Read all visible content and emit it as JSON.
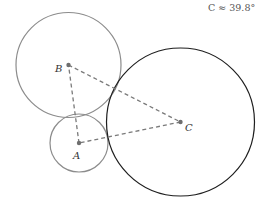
{
  "annotation": {
    "text": "C ≈ 39.8°",
    "x": 208,
    "y": 11
  },
  "colors": {
    "small_circles": "#8c8c8c",
    "large_circle": "#1e1e1e",
    "dashed_lines": "#7a7a7a",
    "points": "#6e6e6e",
    "labels": "#333333"
  },
  "points": {
    "A": {
      "label": "A",
      "x": 79,
      "y": 143,
      "label_x": 73,
      "label_y": 159
    },
    "B": {
      "label": "B",
      "x": 68.5,
      "y": 65,
      "label_x": 55,
      "label_y": 72
    },
    "C": {
      "label": "C",
      "x": 180.5,
      "y": 122,
      "label_x": 185,
      "label_y": 131
    }
  },
  "circles": {
    "A": {
      "cx": 79,
      "cy": 143,
      "r": 29
    },
    "B": {
      "cx": 68.5,
      "cy": 65,
      "r": 52.5
    },
    "C": {
      "cx": 180.5,
      "cy": 122,
      "r": 74
    }
  },
  "triangle": {
    "segments": [
      "AB",
      "BC",
      "CA"
    ],
    "style": "dashed"
  }
}
